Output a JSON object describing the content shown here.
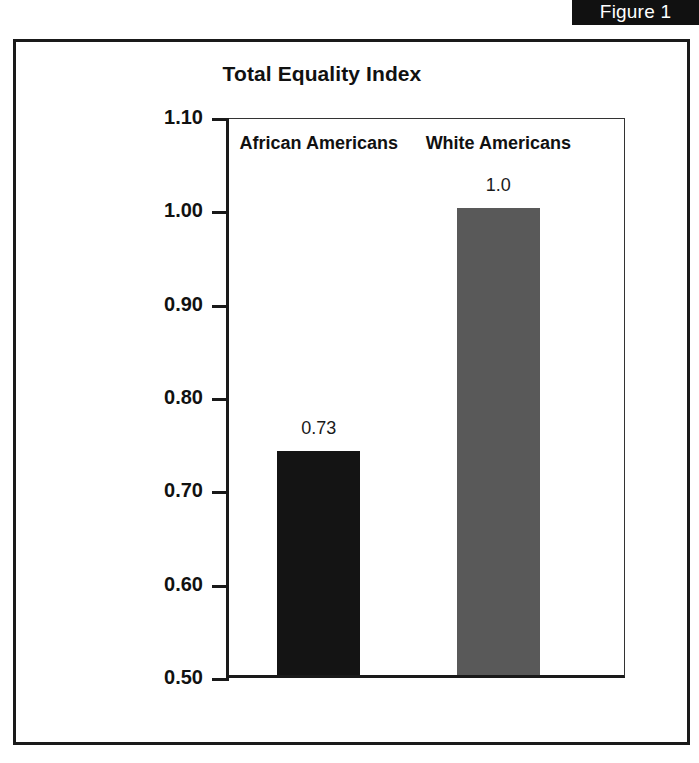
{
  "figure": {
    "banner_label": "Figure 1"
  },
  "chart_data": {
    "type": "bar",
    "title": "Total Equality Index",
    "xlabel": "",
    "ylabel": "",
    "categories": [
      "African Americans",
      "White Americans"
    ],
    "values": [
      0.74,
      1.0
    ],
    "data_labels": [
      "0.73",
      "1.0"
    ],
    "bar_colors": [
      "#141414",
      "#595959"
    ],
    "ylim": [
      0.5,
      1.1
    ],
    "ytick_labels": [
      "1.10",
      "1.00",
      "0.90",
      "0.80",
      "0.70",
      "0.60",
      "0.50"
    ],
    "ytick_values": [
      1.1,
      1.0,
      0.9,
      0.8,
      0.7,
      0.6,
      0.5
    ],
    "grid": false,
    "legend": false
  }
}
